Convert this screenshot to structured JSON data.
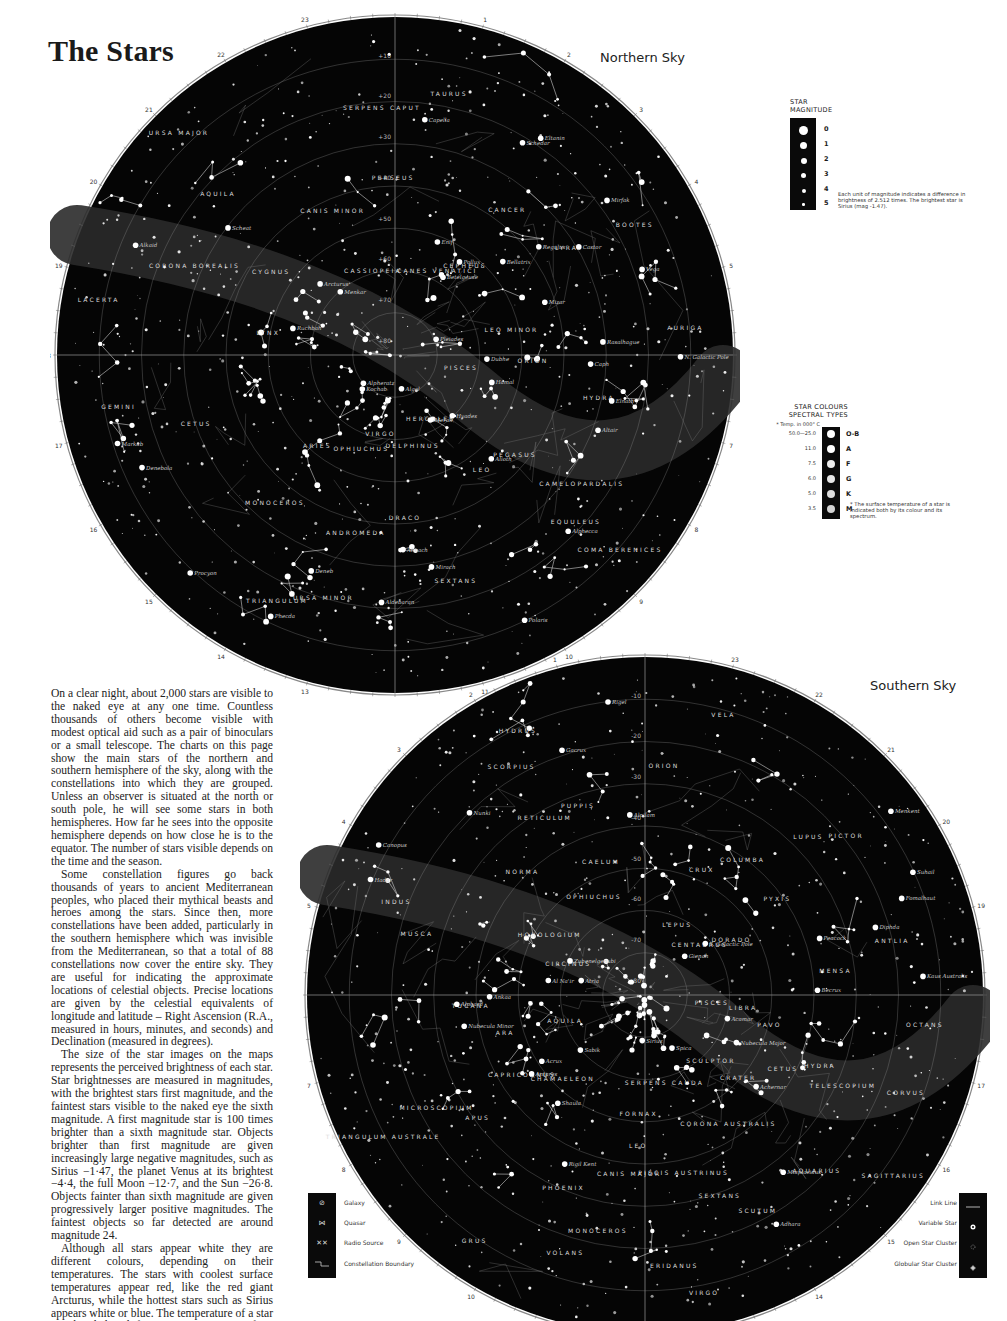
{
  "page": {
    "title": "The Stars"
  },
  "northern_sky": {
    "title": "Northern Sky",
    "center_label": "Polaris",
    "top_label": "0h R.A.",
    "ra_hours": [
      "0h R.A.",
      "1",
      "2",
      "3",
      "4",
      "5",
      "6",
      "7",
      "8",
      "9",
      "10",
      "11",
      "12",
      "13",
      "14",
      "15",
      "16",
      "17",
      "18",
      "19",
      "20",
      "21",
      "22",
      "23"
    ],
    "dec_labels": [
      "+10",
      "+20",
      "+30",
      "+40",
      "+50",
      "+60",
      "+70",
      "+80"
    ],
    "constellations": [
      "PISCES",
      "PEGASUS",
      "EQUULEUS",
      "DELPHINUS",
      "ANDROMEDA",
      "TRIANGULUM",
      "ARIES",
      "CETUS",
      "LACERTA",
      "CYGNUS",
      "AQUILA",
      "CASSIOPEIA",
      "PERSEUS",
      "TAURUS",
      "CEPHEUS",
      "LYRA",
      "AURIGA",
      "ORION",
      "CAMELOPARDALIS",
      "HERCULES",
      "DRACO",
      "URSA MINOR",
      "OPHIUCHUS",
      "MONOCEROS",
      "GEMINI",
      "LYNX",
      "CORONA BOREALIS",
      "URSA MAJOR",
      "CANIS MINOR",
      "SERPENS CAPUT",
      "CANES VENATICI",
      "CANCER",
      "BOOTES",
      "LEO MINOR",
      "HYDRA",
      "COMA BERENICES",
      "LEO",
      "SEXTANS",
      "VIRGO"
    ],
    "stars": [
      "Markab",
      "Enif",
      "Alpheratz",
      "Scheat",
      "Mirach",
      "Hamal",
      "Menkar",
      "Almach",
      "Algol",
      "Pleiades",
      "Hyades",
      "Aldebaran",
      "Altair",
      "Deneb",
      "Schedar",
      "Caph",
      "Ruchbah",
      "Mirfak",
      "Bellatrix",
      "Vega",
      "Capella",
      "Elnath",
      "Betelgeuse",
      "Eltanin",
      "Polaris",
      "Kochab",
      "Rasalhague",
      "Castor",
      "Pollux",
      "Dubhe",
      "Merak",
      "Mizar",
      "Alkaid",
      "Alioth",
      "Phecda",
      "Alphecca",
      "Procyon",
      "Arcturus",
      "Regulus",
      "Denebola",
      "N. Galactic Pole"
    ],
    "other_labels": [
      "Ecliptic",
      "Galactic Equator",
      "M31",
      "M13",
      "M92",
      "M3",
      "M5",
      "M44"
    ]
  },
  "southern_sky": {
    "title": "Southern Sky",
    "top_label": "0h R.A.",
    "ra_hours": [
      "0h R.A.",
      "1",
      "2",
      "3",
      "4",
      "5",
      "6",
      "7",
      "8",
      "9",
      "10",
      "11",
      "12",
      "13",
      "14",
      "15",
      "16",
      "17",
      "18",
      "19",
      "20",
      "21",
      "22",
      "23"
    ],
    "dec_labels": [
      "-10",
      "-20",
      "-30",
      "-40",
      "-50",
      "-60",
      "-70",
      "-80"
    ],
    "constellations": [
      "PISCES",
      "CETUS",
      "AQUARIUS",
      "SCULPTOR",
      "PISCIS AUSTRINUS",
      "ERIDANUS",
      "FORNAX",
      "PHOENIX",
      "GRUS",
      "CAPRICORNUS",
      "MICROSCOPIUM",
      "AQUILA",
      "TUCANA",
      "INDUS",
      "HOROLOGIUM",
      "RETICULUM",
      "HYDRUS",
      "CAELUM",
      "ORION",
      "LEPUS",
      "COLUMBA",
      "PICTOR",
      "DORADO",
      "MENSA",
      "OCTANS",
      "PAVO",
      "TELESCOPIUM",
      "SAGITTARIUS",
      "CORONA AUSTRALIS",
      "SCUTUM",
      "SERPENS CAUDA",
      "CANIS MAJOR",
      "VOLANS",
      "CHAMAELEON",
      "APUS",
      "TRIANGULUM AUSTRALE",
      "ARA",
      "MUSCA",
      "CIRCINUS",
      "NORMA",
      "SCORPIUS",
      "OPHIUCHUS",
      "PUPPIS",
      "VELA",
      "CRUX",
      "LUPUS",
      "CENTAURUS",
      "PYXIS",
      "ANTLIA",
      "LIBRA",
      "HYDRA",
      "CORVUS",
      "CRATER",
      "SEXTANS",
      "VIRGO",
      "LEO",
      "MONOCEROS"
    ],
    "stars": [
      "Diphda",
      "Fomalhaut",
      "Ankaa",
      "Al Na'ir",
      "Acamar",
      "Achernar",
      "Rigel",
      "Alnilam",
      "Canopus",
      "Sirius",
      "Adhara",
      "Peacock",
      "Nunki",
      "Kaus Australis",
      "Atria",
      "Shaula",
      "Antares",
      "Rigil Kent",
      "Hadar",
      "Acrux",
      "Becrux",
      "Gacrux",
      "Suhail",
      "Menkent",
      "Alphard",
      "Gienah",
      "Spica",
      "Zubenelgenubi",
      "Sabik",
      "Miaplacidus",
      "Nubecula Minor",
      "Nubecula Major",
      "S. Galactic Pole"
    ],
    "other_labels": [
      "Ecliptic",
      "Equator"
    ]
  },
  "magnitude_legend": {
    "title_line1": "STAR",
    "title_line2": "MAGNITUDE",
    "levels": [
      "0",
      "1",
      "2",
      "3",
      "4",
      "5"
    ],
    "note": "Each unit of magnitude indicates a difference in brightness of 2.512 times. The brightest star is Sirius (mag -1.47)."
  },
  "spectral_legend": {
    "title_line1": "STAR COLOURS",
    "title_line2": "SPECTRAL TYPES",
    "temp_header": "* Temp. in 000° C",
    "rows": [
      {
        "temp": "50.0—25.0",
        "type": "O-B"
      },
      {
        "temp": "11.0",
        "type": "A"
      },
      {
        "temp": "7.5",
        "type": "F"
      },
      {
        "temp": "6.0",
        "type": "G"
      },
      {
        "temp": "5.0",
        "type": "K"
      },
      {
        "temp": "3.5",
        "type": "M"
      }
    ],
    "note": "* The surface temperature of a star is indicated both by its colour and its spectrum."
  },
  "symbol_legend": {
    "items": [
      {
        "label": "Galaxy",
        "icon": "galaxy-icon"
      },
      {
        "label": "Quasar",
        "icon": "quasar-icon"
      },
      {
        "label": "Radio Source",
        "icon": "radio-source-icon"
      },
      {
        "label": "Constellation Boundary",
        "icon": "boundary-icon"
      }
    ]
  },
  "link_legend": {
    "items": [
      {
        "label": "Link Line",
        "icon": "link-line-icon"
      },
      {
        "label": "Variable Star",
        "icon": "variable-star-icon"
      },
      {
        "label": "Open Star Cluster",
        "icon": "open-cluster-icon"
      },
      {
        "label": "Globular Star Cluster",
        "icon": "globular-cluster-icon"
      }
    ]
  },
  "body_text": {
    "paragraphs": [
      "On a clear night, about 2,000 stars are visible to the naked eye at any one time. Countless thousands of others become visible with modest optical aid such as a pair of binoculars or a small telescope. The charts on this page show the main stars of the northern and southern hemisphere of the sky, along with the constellations into which they are grouped. Unless an observer is situated at the north or south pole, he will see some stars in both hemispheres. How far he sees into the opposite hemisphere depends on how close he is to the equator. The number of stars visible depends on the time and the season.",
      "Some constellation figures go back thousands of years to ancient Mediterranean peoples, who placed their mythical beasts and heroes among the stars. Since then, more constellations have been added, particularly in the southern hemisphere which was invisible from the Mediterranean, so that a total of 88 constellations now cover the entire sky. They are useful for indicating the approximate locations of celestial objects. Precise locations are given by the celestial equivalents of longitude and latitude – Right Ascension (R.A., measured in hours, minutes, and seconds) and Declination (measured in degrees).",
      "The size of the star images on the maps represents the perceived brightness of each star. Star brightnesses are measured in magnitudes, with the brightest stars first magnitude, and the faintest stars visible to the naked eye the sixth magnitude. A first magnitude star is 100 times brighter than a sixth magnitude star. Objects brighter than first magnitude are given increasingly large negative magnitudes, such as Sirius −1·47, the planet Venus at its brightest −4·4, the full Moon −12·7, and the Sun −26·8. Objects fainter than sixth magnitude are given progressively larger positive magnitudes. The faintest objects so far detected are around magnitude 24.",
      "Although all stars appear white they are different colours, depending on their temperatures. The stars with coolest surface temperatures appear red, like the red giant Arcturus, while the hottest stars such as Sirius appears white or blue. The temperature of a star can be deduced from an examination of its spectrum; this classification is known as a star's spectral type."
    ]
  },
  "colors": {
    "sky": "#050505",
    "paper": "#ffffff",
    "text": "#1a1a1a",
    "star": "#ffffff",
    "grid": "#9a9a9a"
  }
}
